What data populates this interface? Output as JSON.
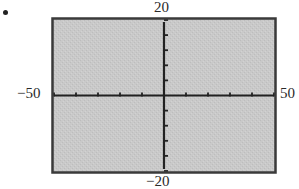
{
  "figure": {
    "marker": "."
  },
  "chart_data": {
    "type": "line",
    "title": "",
    "xlabel": "",
    "ylabel": "",
    "xlim": [
      -50,
      50
    ],
    "ylim": [
      -20,
      20
    ],
    "x_tick_step": 10,
    "y_tick_step": 4,
    "x_ticks": [
      -50,
      -40,
      -30,
      -20,
      -10,
      0,
      10,
      20,
      30,
      40,
      50
    ],
    "y_ticks": [
      -20,
      -16,
      -12,
      -8,
      -4,
      0,
      4,
      8,
      12,
      16,
      20
    ],
    "labels": {
      "xmin": "−50",
      "xmax": "50",
      "ymin": "−20",
      "ymax": "20"
    },
    "series": [],
    "grid": false,
    "background": "#c8c8c8",
    "frame_color": "#333333",
    "axis_color": "#222222"
  }
}
